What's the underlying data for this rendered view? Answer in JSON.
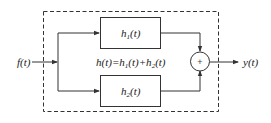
{
  "diagram": {
    "type": "block-diagram",
    "input": {
      "label": "f(t)"
    },
    "output": {
      "label": "y(t)"
    },
    "blocks": [
      {
        "id": "h1",
        "label": "h",
        "subscript": "1",
        "suffix": "(t)"
      },
      {
        "id": "h2",
        "label": "h",
        "subscript": "2",
        "suffix": "(t)"
      }
    ],
    "summer": {
      "symbol": "+"
    },
    "equation": {
      "parts": [
        "h(t)=h",
        "1",
        "(t)+h",
        "2",
        "(t)"
      ],
      "full": "h(t)=h1(t)+h2(t)"
    },
    "colors": {
      "stroke": "#333333",
      "background": "#ffffff"
    }
  }
}
